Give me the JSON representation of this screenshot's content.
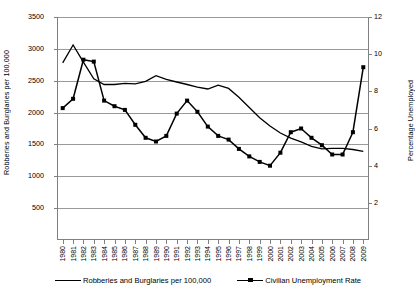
{
  "chart_data": {
    "type": "line",
    "title": "",
    "xlabel": "",
    "ylabel": "Robberies and Burglaries per 100,000",
    "ylabel_right": "Percentage Unemployed",
    "grid": true,
    "legend_position": "bottom",
    "x": [
      1980,
      1981,
      1982,
      1983,
      1984,
      1985,
      1986,
      1987,
      1988,
      1989,
      1990,
      1991,
      1992,
      1993,
      1994,
      1995,
      1996,
      1997,
      1998,
      1999,
      2000,
      2001,
      2002,
      2003,
      2004,
      2005,
      2006,
      2007,
      2008,
      2009
    ],
    "xtick_labels": [
      "1980",
      "1981",
      "1982",
      "1983",
      "1984",
      "1985",
      "1986",
      "1987",
      "1988",
      "1989",
      "1990",
      "1991",
      "1992",
      "1993",
      "1994",
      "1995",
      "1996",
      "1997",
      "1998",
      "1999",
      "2000",
      "2001",
      "2002",
      "2003",
      "2004",
      "2005",
      "2006",
      "2007",
      "2008",
      "2009"
    ],
    "ylim": [
      0,
      3500
    ],
    "ytick_labels": [
      "500",
      "1000",
      "1500",
      "2000",
      "2500",
      "3000",
      "3500"
    ],
    "ytick_values": [
      500,
      1000,
      1500,
      2000,
      2500,
      3000,
      3500
    ],
    "ylim_right": [
      0,
      12
    ],
    "ytick_labels_right": [
      "2",
      "4",
      "6",
      "8",
      "10",
      "12"
    ],
    "ytick_values_right": [
      2,
      4,
      6,
      8,
      10,
      12
    ],
    "series": [
      {
        "name": "Robberies and Burglaries per 100,000",
        "axis": "left",
        "marker": "none",
        "color": "#000000",
        "values": [
          2780,
          3060,
          2790,
          2530,
          2440,
          2440,
          2460,
          2450,
          2490,
          2580,
          2520,
          2480,
          2440,
          2400,
          2370,
          2430,
          2380,
          2240,
          2080,
          1920,
          1790,
          1680,
          1600,
          1540,
          1470,
          1430,
          1440,
          1440,
          1420,
          1390
        ]
      },
      {
        "name": "Civilian Unemployment Rate",
        "axis": "right",
        "marker": "square",
        "color": "#000000",
        "values": [
          7.1,
          7.6,
          9.7,
          9.6,
          7.5,
          7.2,
          7.0,
          6.2,
          5.5,
          5.3,
          5.6,
          6.8,
          7.5,
          6.9,
          6.1,
          5.6,
          5.4,
          4.9,
          4.5,
          4.2,
          4.0,
          4.7,
          5.8,
          6.0,
          5.5,
          5.1,
          4.6,
          4.6,
          5.8,
          9.3
        ]
      }
    ],
    "legend": [
      "Robberies and Burglaries per 100,000",
      "Civilian Unemployment Rate"
    ]
  }
}
